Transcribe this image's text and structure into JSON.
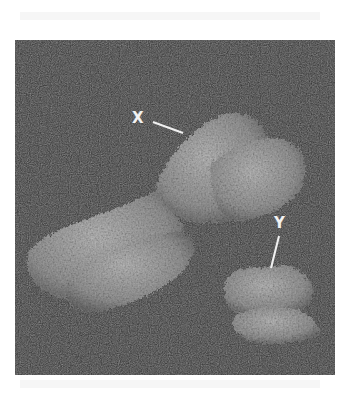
{
  "figure": {
    "background_color": "#2e2e2e",
    "page_color": "#ffffff",
    "chromosome_color": "#a8a8a8",
    "label_color": "#f2f2f2",
    "labels": [
      {
        "text": "X",
        "target": "X chromosome"
      },
      {
        "text": "Y",
        "target": "Y chromosome"
      }
    ]
  }
}
